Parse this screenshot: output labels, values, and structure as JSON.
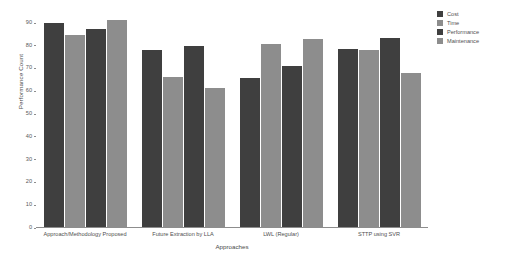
{
  "chart_data": {
    "type": "bar",
    "title": "",
    "xlabel": "Approaches",
    "ylabel": "Performance Count",
    "categories": [
      "Approach/Methodology Proposed",
      "Future Extraction by LLA",
      "LWL (Regular)",
      "STTP using SVR"
    ],
    "series": [
      {
        "name": "Cost",
        "color": "#3f3f3f",
        "values": [
          90,
          78,
          66,
          78.5
        ]
      },
      {
        "name": "Time",
        "color": "#8d8d8d",
        "values": [
          85,
          66.5,
          81,
          78
        ]
      },
      {
        "name": "Performance",
        "color": "#3f3f3f",
        "values": [
          87.5,
          80,
          71,
          83.5
        ]
      },
      {
        "name": "Maintenance",
        "color": "#8d8d8d",
        "values": [
          91.5,
          61.5,
          83,
          68
        ]
      }
    ],
    "ylim": [
      0,
      94
    ],
    "yticks": [
      0,
      10,
      20,
      30,
      40,
      50,
      60,
      70,
      80,
      90
    ],
    "ytick_labels": [
      "0",
      "10",
      "20",
      "30",
      "40",
      "50",
      "60",
      "70",
      "80",
      "90"
    ],
    "grid": false,
    "legend_position": "right"
  },
  "legend": {
    "items": [
      {
        "label": "Cost",
        "color": "#3f3f3f"
      },
      {
        "label": "Time",
        "color": "#8d8d8d"
      },
      {
        "label": "Performance",
        "color": "#3f3f3f"
      },
      {
        "label": "Maintenance",
        "color": "#8d8d8d"
      }
    ]
  }
}
